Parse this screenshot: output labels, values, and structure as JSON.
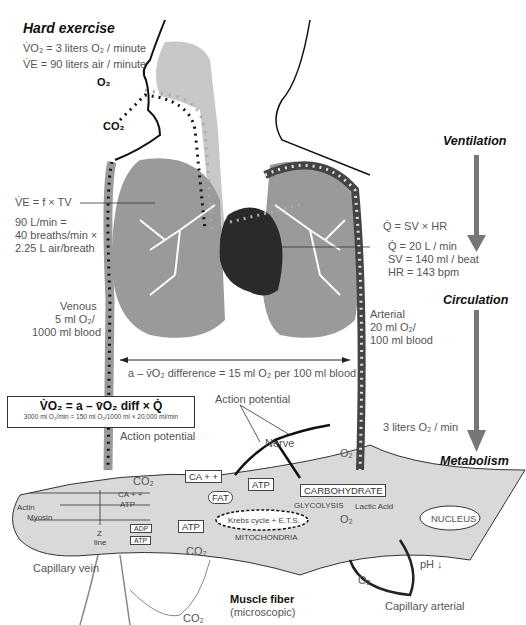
{
  "header": {
    "title": "Hard exercise",
    "vo2": "V̇O₂ = 3 liters O₂ / minute",
    "ve": "V̇E = 90 liters air / minute"
  },
  "respiration": {
    "o2_in": "O₂",
    "co2_out": "CO₂",
    "ve_formula": "V̇E = f × TV",
    "ve_calc_1": "90 L/min =",
    "ve_calc_2": "40 breaths/min ×",
    "ve_calc_3": "2.25 L air/breath"
  },
  "cardiac": {
    "q_formula": "Q̇ = SV × HR",
    "q_value": "Q̇ = 20 L / min",
    "sv_value": "SV = 140 ml / beat",
    "hr_value": "HR = 143 bpm"
  },
  "blood": {
    "venous_1": "Venous",
    "venous_2": "5 ml O₂/",
    "venous_3": "1000 ml blood",
    "arterial_1": "Arterial",
    "arterial_2": "20 ml O₂/",
    "arterial_3": "100 ml blood",
    "avo2_difference": "a – v̄O₂ difference = 15 ml O₂ per 100 ml blood"
  },
  "fick": {
    "equation": "V̇O₂ = a – v̄O₂ diff × Q̇",
    "calculation": "3000 ml O₂/min = 150 ml O₂/1000 ml × 20,000 ml/min"
  },
  "stages": {
    "ventilation": "Ventilation",
    "circulation": "Circulation",
    "metabolism": "Metabolism",
    "delivery": "3 liters O₂ / min"
  },
  "muscle": {
    "action_potential_top": "Action potential",
    "action_potential_left": "Action potential",
    "nerve": "Nerve",
    "o2_top": "O₂",
    "co2_top": "CO₂",
    "ca": "CA + +",
    "ca_inner": "CA + +",
    "atp_inner": "ATP",
    "atp_top": "ATP",
    "carbohydrate": "CARBOHYDRATE",
    "glycolysis": "GLYCOLYSIS",
    "lactic_acid": "Lactic Acid",
    "fat": "FAT",
    "atp_left": "ATP",
    "krebs": "Krebs cycle + E.T.S.",
    "mitochondria": "MITOCHONDRIA",
    "nucleus": "NUCLEUS",
    "co2_mito": "CO₂",
    "o2_mito": "O₂",
    "actin": "Actin",
    "myosin": "Myosin",
    "z_line_1": "Z",
    "z_line_2": "line",
    "adp": "ADP",
    "atp_box": "ATP",
    "capillary_vein": "Capillary vein",
    "capillary_arterial": "Capillary arterial",
    "o2_capillary": "O₂",
    "ph": "pH ↓",
    "co2_bottom": "CO₂",
    "fiber_title": "Muscle fiber",
    "fiber_sub": "(microscopic)"
  },
  "colors": {
    "lung": "#9a9a9a",
    "airway": "#c8c8c8",
    "heart": "#2a2a2a",
    "fiber": "#d9d9d9",
    "stage_arrow": "#777777"
  }
}
